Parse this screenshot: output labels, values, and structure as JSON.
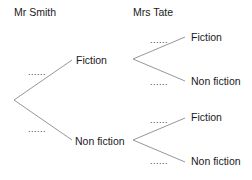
{
  "headers": {
    "first": "Mr Smith",
    "second": "Mrs Tate"
  },
  "first_stage": {
    "upper": {
      "label": "Fiction",
      "probability": "......"
    },
    "lower": {
      "label": "Non fiction",
      "probability": "......"
    }
  },
  "second_stage": {
    "after_fiction": {
      "upper": {
        "label": "Fiction",
        "probability": "......"
      },
      "lower": {
        "label": "Non fiction",
        "probability": "......"
      }
    },
    "after_non_fiction": {
      "upper": {
        "label": "Fiction",
        "probability": "......"
      },
      "lower": {
        "label": "Non fiction",
        "probability": "......"
      }
    }
  },
  "colors": {
    "line": "#8a8a8a",
    "text": "#1a1a1a"
  }
}
